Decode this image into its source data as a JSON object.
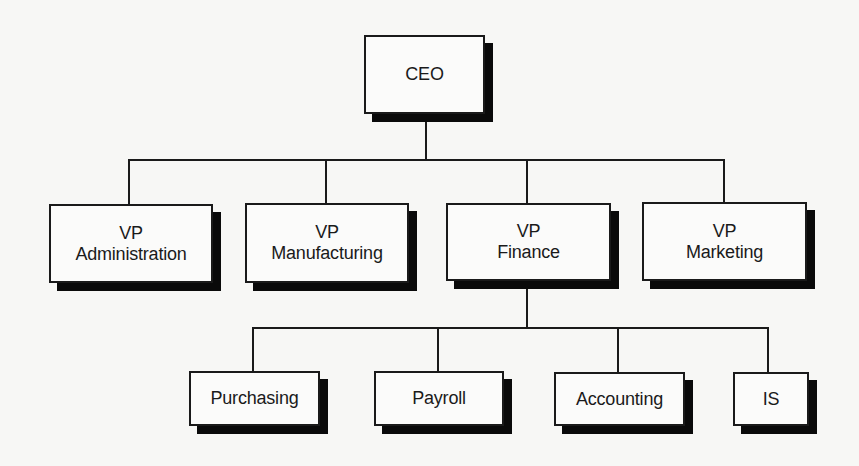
{
  "diagram": {
    "type": "org-chart",
    "root": {
      "title": "CEO",
      "children": [
        {
          "line1": "VP",
          "line2": "Administration"
        },
        {
          "line1": "VP",
          "line2": "Manufacturing"
        },
        {
          "line1": "VP",
          "line2": "Finance",
          "children": [
            {
              "label": "Purchasing"
            },
            {
              "label": "Payroll"
            },
            {
              "label": "Accounting"
            },
            {
              "label": "IS"
            }
          ]
        },
        {
          "line1": "VP",
          "line2": "Marketing"
        }
      ]
    }
  },
  "colors": {
    "background": "#f7f7f5",
    "box_fill": "#fbfbfa",
    "stroke": "#1a1a1a",
    "shadow": "#0a0a0a"
  }
}
